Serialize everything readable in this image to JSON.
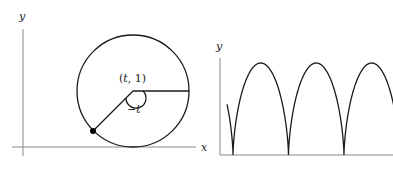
{
  "left_figure": {
    "axis_labels": {
      "y": "y",
      "x": "x"
    },
    "center_label_open": "(",
    "center_label_t": "t",
    "center_label_rest": ", 1)",
    "angle_label": "−t",
    "geometry": {
      "origin_px": [
        23,
        147
      ],
      "circle_center_px": [
        133,
        91
      ],
      "circle_radius_px": 56,
      "point_px": [
        93,
        131
      ]
    }
  },
  "right_figure": {
    "axis_labels": {
      "y": "y"
    },
    "geometry": {
      "origin_px": [
        220,
        155
      ],
      "first_cusp_px": 233,
      "x_scale_px_per_unit": 8.83,
      "y_scale_px_per_unit": 46,
      "t_start": -1.67,
      "t_end": 17.25
    }
  },
  "chart_data": {
    "type": "line",
    "title": "",
    "series": [
      {
        "name": "cycloid",
        "equation": "x = t - sin t, y = 1 - cos t",
        "cusps_x": [
          0,
          6.283,
          12.566
        ],
        "peaks": [
          [
            3.1416,
            2
          ],
          [
            9.4248,
            2
          ],
          [
            15.708,
            2
          ]
        ]
      }
    ],
    "xlabel": "x",
    "ylabel": "y",
    "ylim": [
      0,
      2
    ],
    "annotations": [
      "(t, 1)",
      "−t"
    ],
    "grid": false
  }
}
